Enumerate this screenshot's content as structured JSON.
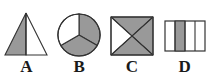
{
  "figure": {
    "kind": "geometry-shaded-fractions-figure",
    "background_color": "#ffffff",
    "shade_color": "#999999",
    "unshaded_color": "#ffffff",
    "stroke_color": "#333333",
    "labels": [
      "A",
      "B",
      "C",
      "D"
    ],
    "items": [
      {
        "label": "A",
        "shape_name": "triangle",
        "description": "isosceles triangle split by a vertical median, left half shaded",
        "parts_total": 2,
        "parts_shaded": 1,
        "fraction": "1/2"
      },
      {
        "label": "B",
        "shape_name": "circle",
        "description": "circle divided into three sectors, two shaded",
        "parts_total": 3,
        "parts_shaded": 2,
        "fraction": "2/3"
      },
      {
        "label": "C",
        "shape_name": "rectangle",
        "description": "rectangle with both diagonals forming four triangles, three shaded",
        "parts_total": 4,
        "parts_shaded": 3,
        "fraction": "3/4"
      },
      {
        "label": "D",
        "shape_name": "rectangle",
        "description": "rectangle divided into four vertical strips, second strip shaded",
        "parts_total": 4,
        "parts_shaded": 1,
        "fraction": "1/4"
      }
    ]
  }
}
